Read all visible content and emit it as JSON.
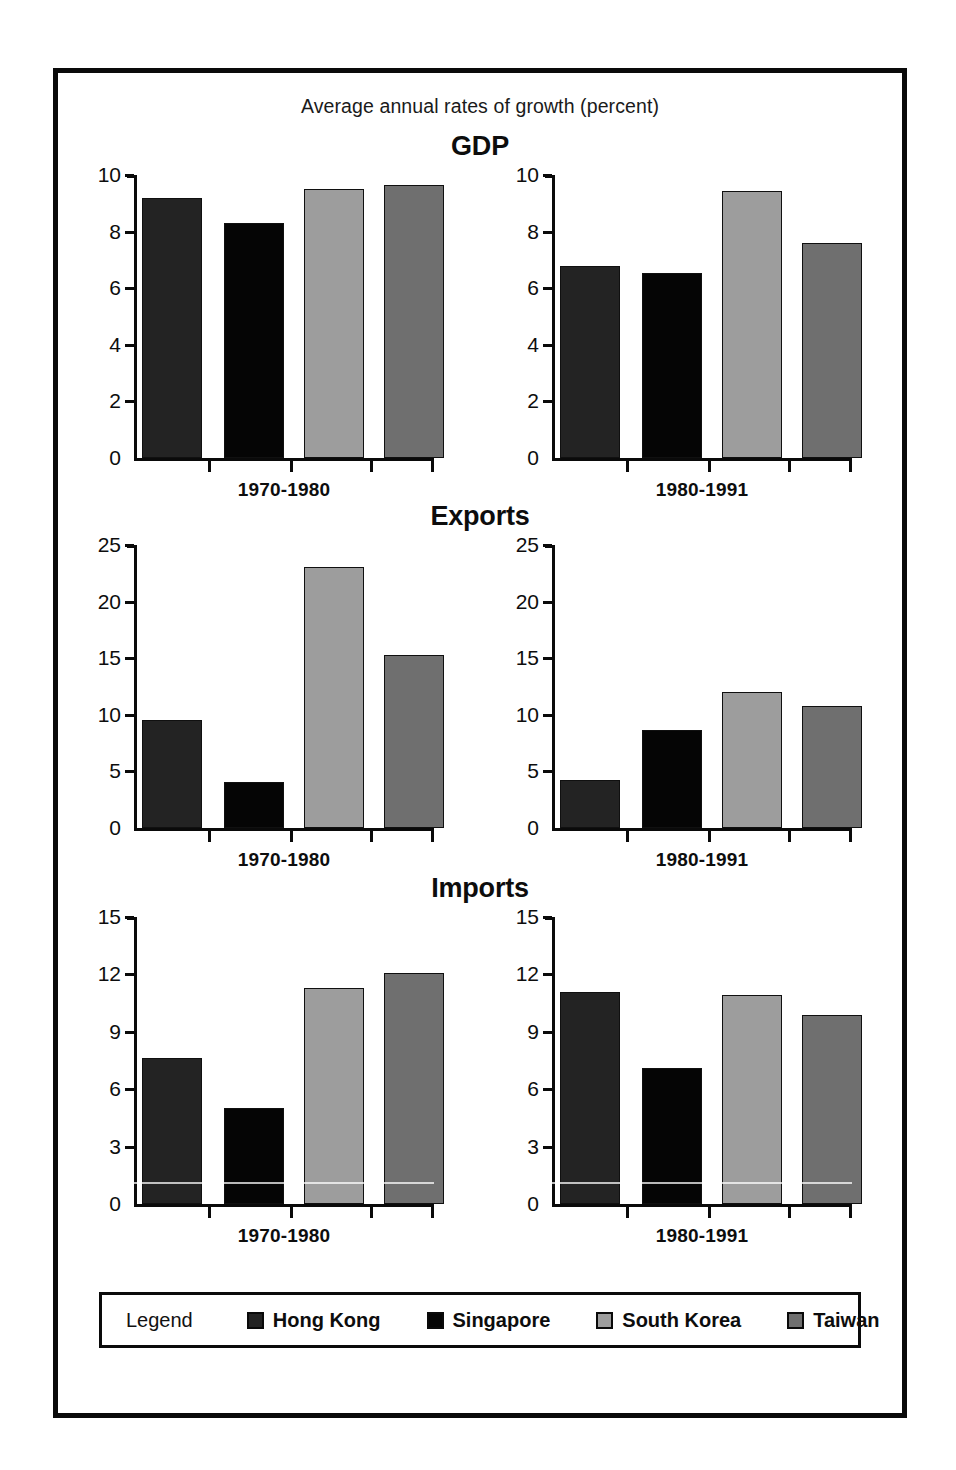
{
  "figure": {
    "subtitle": "Average annual rates of growth (percent)"
  },
  "legend": {
    "title": "Legend",
    "items": [
      {
        "label": "Hong Kong",
        "key": "hk",
        "color": "#232323"
      },
      {
        "label": "Singapore",
        "key": "sg",
        "color": "#050505"
      },
      {
        "label": "South Korea",
        "key": "kr",
        "color": "#9d9d9d"
      },
      {
        "label": "Taiwan",
        "key": "tw",
        "color": "#6f6f6f"
      }
    ]
  },
  "groups": [
    {
      "id": "gdp",
      "title": "GDP",
      "panels": [
        {
          "period": "1970-1980"
        },
        {
          "period": "1980-1991"
        }
      ]
    },
    {
      "id": "exports",
      "title": "Exports",
      "panels": [
        {
          "period": "1970-1980"
        },
        {
          "period": "1980-1991"
        }
      ]
    },
    {
      "id": "imports",
      "title": "Imports",
      "panels": [
        {
          "period": "1970-1980"
        },
        {
          "period": "1980-1991"
        }
      ]
    }
  ],
  "chart_data": [
    {
      "type": "bar",
      "title": "GDP",
      "subtitle": "Average annual rates of growth (percent)",
      "panel": "1970-1980",
      "xlabel": "1970-1980",
      "ylabel": "",
      "ylim": [
        0,
        10
      ],
      "yticks": [
        0,
        2,
        4,
        6,
        8,
        10
      ],
      "grid": false,
      "legend_position": "bottom",
      "categories": [
        "Hong Kong",
        "Singapore",
        "South Korea",
        "Taiwan"
      ],
      "values": [
        9.2,
        8.3,
        9.5,
        9.65
      ]
    },
    {
      "type": "bar",
      "title": "GDP",
      "panel": "1980-1991",
      "xlabel": "1980-1991",
      "ylabel": "",
      "ylim": [
        0,
        10
      ],
      "yticks": [
        0,
        2,
        4,
        6,
        8,
        10
      ],
      "grid": false,
      "categories": [
        "Hong Kong",
        "Singapore",
        "South Korea",
        "Taiwan"
      ],
      "values": [
        6.8,
        6.55,
        9.45,
        7.6
      ]
    },
    {
      "type": "bar",
      "title": "Exports",
      "panel": "1970-1980",
      "xlabel": "1970-1980",
      "ylabel": "",
      "ylim": [
        0,
        25
      ],
      "yticks": [
        0,
        5,
        10,
        15,
        20,
        25
      ],
      "grid": false,
      "categories": [
        "Hong Kong",
        "Singapore",
        "South Korea",
        "Taiwan"
      ],
      "values": [
        9.5,
        4.1,
        23.1,
        15.3
      ]
    },
    {
      "type": "bar",
      "title": "Exports",
      "panel": "1980-1991",
      "xlabel": "1980-1991",
      "ylabel": "",
      "ylim": [
        0,
        25
      ],
      "yticks": [
        0,
        5,
        10,
        15,
        20,
        25
      ],
      "grid": false,
      "categories": [
        "Hong Kong",
        "Singapore",
        "South Korea",
        "Taiwan"
      ],
      "values": [
        4.2,
        8.7,
        12.0,
        10.8
      ]
    },
    {
      "type": "bar",
      "title": "Imports",
      "panel": "1970-1980",
      "xlabel": "1970-1980",
      "ylabel": "",
      "ylim": [
        0,
        15
      ],
      "yticks": [
        0,
        3,
        6,
        9,
        12,
        15
      ],
      "grid": false,
      "categories": [
        "Hong Kong",
        "Singapore",
        "South Korea",
        "Taiwan"
      ],
      "values": [
        7.65,
        5.0,
        11.3,
        12.05
      ]
    },
    {
      "type": "bar",
      "title": "Imports",
      "panel": "1980-1991",
      "xlabel": "1980-1991",
      "ylabel": "",
      "ylim": [
        0,
        15
      ],
      "yticks": [
        0,
        3,
        6,
        9,
        12,
        15
      ],
      "grid": false,
      "categories": [
        "Hong Kong",
        "Singapore",
        "South Korea",
        "Taiwan"
      ],
      "values": [
        11.1,
        7.1,
        10.9,
        9.9
      ]
    }
  ]
}
